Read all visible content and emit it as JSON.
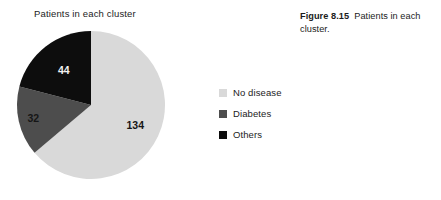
{
  "chart_data": {
    "type": "pie",
    "title": "Patients in each cluster",
    "categories": [
      "No disease",
      "Diabetes",
      "Others"
    ],
    "values": [
      134,
      32,
      44
    ],
    "labels": [
      "134",
      "32",
      "44"
    ],
    "total": 210,
    "colors": [
      "#d9d9d9",
      "#4d4d4d",
      "#0d0d0d"
    ],
    "label_colors": [
      "dark",
      "dark",
      "light"
    ],
    "start_angle_deg": 0,
    "direction": "clockwise",
    "legend_position": "right",
    "grid": false,
    "xlabel": "",
    "ylabel": ""
  },
  "legend": {
    "items": [
      {
        "label": "No disease",
        "color": "#d9d9d9"
      },
      {
        "label": "Diabetes",
        "color": "#4d4d4d"
      },
      {
        "label": "Others",
        "color": "#0d0d0d"
      }
    ]
  },
  "caption": {
    "number": "Figure 8.15",
    "text": "Patients in each cluster."
  },
  "geometry": {
    "cx": 91,
    "cy": 105,
    "r": 74
  }
}
